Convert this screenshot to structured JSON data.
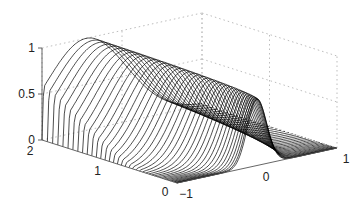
{
  "chart_data": {
    "type": "line",
    "subtype": "3d-line-family",
    "title": "",
    "xlabel": "",
    "ylabel": "",
    "zlabel": "",
    "axes": {
      "x": {
        "range": [
          -1,
          1
        ],
        "ticks": [
          -1,
          0,
          1
        ],
        "tick_labels": [
          "−1",
          "0",
          "1"
        ]
      },
      "t": {
        "range": [
          0,
          2
        ],
        "ticks": [
          0,
          1,
          2
        ],
        "tick_labels": [
          "0",
          "1",
          "2"
        ]
      },
      "z": {
        "range": [
          0,
          1
        ],
        "ticks": [
          0,
          0.5,
          1
        ],
        "tick_labels": [
          "0",
          "0.5",
          "1"
        ]
      }
    },
    "grid": true,
    "grid_style": "dotted",
    "legend": null,
    "series_description": "Family of curves u(x,t) for t from 0 to 2; at t=0 a narrow peak (height ~0.72) centered near x=0; as t increases the profile broadens into a sine-like hump reaching ~1.0 near x=-0.45 at t=2, vanishing at x=-1.",
    "num_curves": 40,
    "peak_t0": {
      "x": 0,
      "z": 0.72
    },
    "max_t2": {
      "x": -0.45,
      "z": 1.0
    },
    "line_color": "#000000",
    "grid_color": "#bbbbbb"
  }
}
